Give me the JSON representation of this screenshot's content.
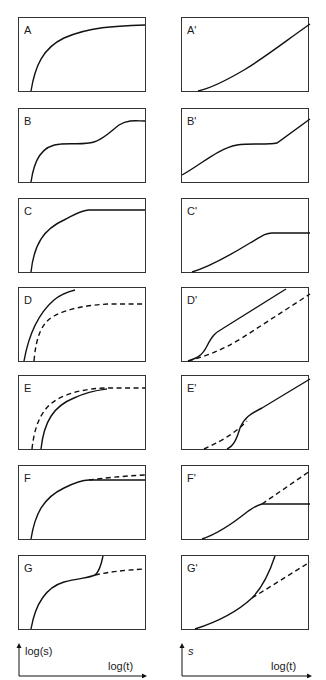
{
  "panels": {
    "A": {
      "label": "A"
    },
    "A_prime": {
      "label": "A'"
    },
    "B": {
      "label": "B"
    },
    "B_prime": {
      "label": "B'"
    },
    "C": {
      "label": "C"
    },
    "C_prime": {
      "label": "C'"
    },
    "D": {
      "label": "D"
    },
    "D_prime": {
      "label": "D'"
    },
    "E": {
      "label": "E"
    },
    "E_prime": {
      "label": "E'"
    },
    "F": {
      "label": "F"
    },
    "F_prime": {
      "label": "F'"
    },
    "G": {
      "label": "G"
    },
    "G_prime": {
      "label": "G'"
    }
  },
  "axes_key": {
    "left": {
      "y_label": "log(s)",
      "x_label": "log(t)"
    },
    "right": {
      "y_label": "s",
      "x_label": "log(t)"
    }
  },
  "columns": {
    "left": "log-log plots (A–G)",
    "right": "semi-log plots (A'–G')"
  },
  "line_styles": {
    "solid": "#111111",
    "dashed": "#111111"
  }
}
